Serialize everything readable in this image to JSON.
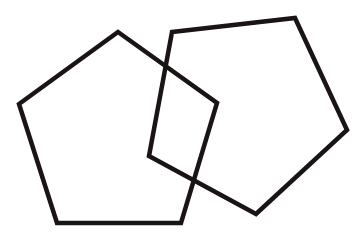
{
  "diagram": {
    "background": "#ffffff",
    "stroke_color": "#1a1414",
    "shapes": [
      {
        "name": "left-pentagon",
        "type": "pentagon",
        "points": "118,32 217,103 181,223 57,223 19,104"
      },
      {
        "name": "right-pentagon",
        "type": "pentagon",
        "points": "172,32 295,18 347,130 256,214 149,156"
      }
    ]
  }
}
